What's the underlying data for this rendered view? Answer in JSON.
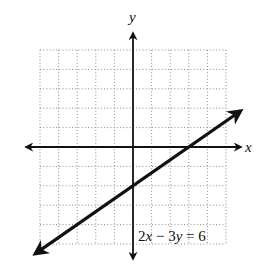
{
  "chart_data": {
    "type": "line",
    "title": "",
    "xlabel": "x",
    "ylabel": "y",
    "xlim": [
      -5,
      5
    ],
    "ylim": [
      -5,
      5
    ],
    "grid": true,
    "grid_style": "dotted",
    "grid_step": 1,
    "tick_labels": false,
    "series": [
      {
        "name": "2x − 3y = 6",
        "equation": "2x - 3y = 6",
        "slope": 0.6667,
        "y_intercept": -2,
        "x_intercept": 3,
        "x": [
          -5.27,
          0,
          3,
          5.8
        ],
        "values": [
          -5.51,
          -2,
          0,
          1.87
        ],
        "arrows_both_ends": true
      }
    ],
    "annotations": [
      {
        "text": "2x − 3y = 6",
        "position": "lower-right, near y-axis"
      }
    ]
  },
  "labels": {
    "x_axis": "x",
    "y_axis": "y",
    "equation": {
      "part1": "2",
      "var1": "x",
      "op": " − 3",
      "var2": "y",
      "rest": " = 6"
    }
  },
  "colors": {
    "line": "#111111",
    "axis": "#111111",
    "grid": "#8a8a8a",
    "background": "#ffffff"
  }
}
